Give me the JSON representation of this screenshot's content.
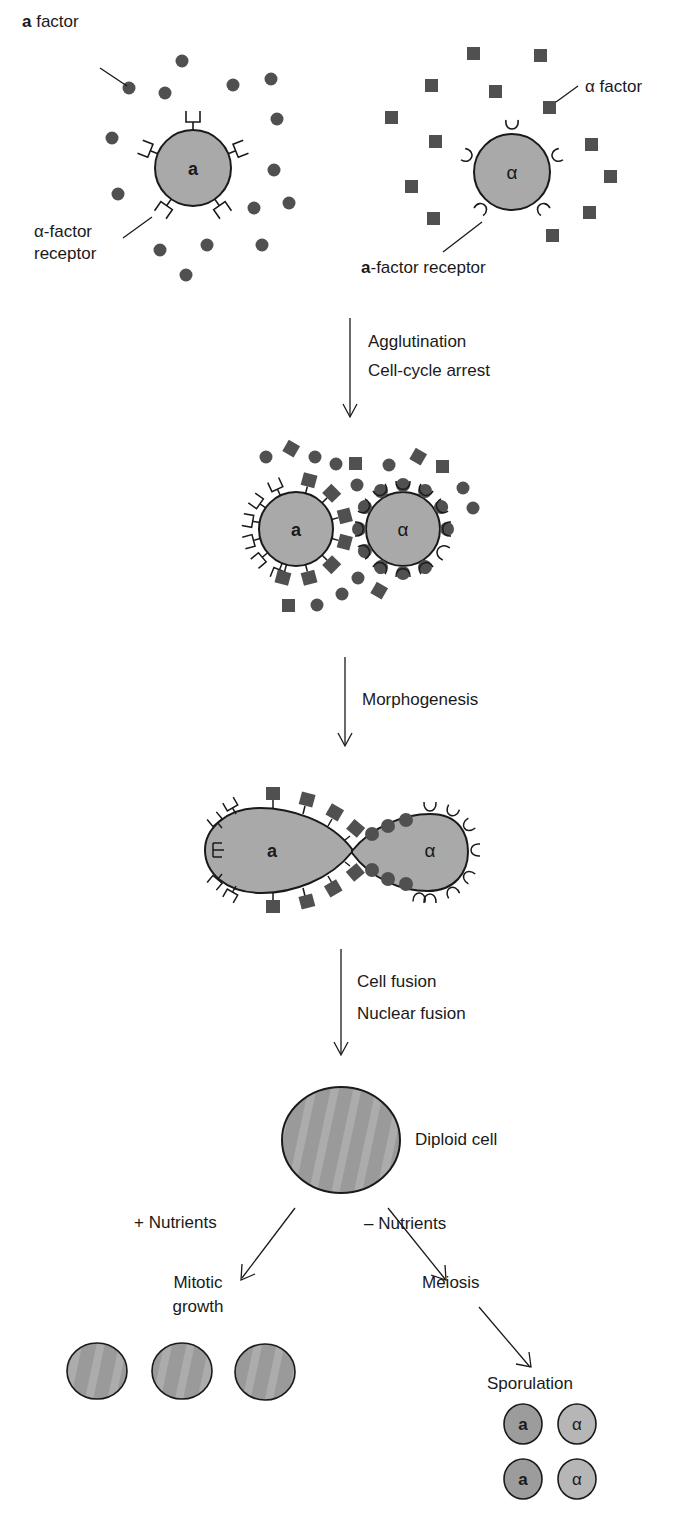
{
  "colors": {
    "cell_fill": "#a9a9a9",
    "cell_stroke": "#1a1a1a",
    "factor_fill": "#505050",
    "diploid_fill": "#9a9a9a",
    "spore_a_fill": "#9c9c9c",
    "spore_alpha_fill": "#b6b6b6",
    "text": "#1a1a1a",
    "background": "#ffffff"
  },
  "stage1": {
    "a_cell": {
      "label": "a",
      "factor_label_bold": "a",
      "factor_label_rest": " factor",
      "receptor_label_line1": "α-factor",
      "receptor_label_line2": "receptor",
      "factor_shape": "circle",
      "receptor_shape": "square-cup"
    },
    "alpha_cell": {
      "label": "α",
      "factor_label": "α factor",
      "receptor_label_bold": "a",
      "receptor_label_rest": "-factor receptor",
      "factor_shape": "square",
      "receptor_shape": "round-cup"
    }
  },
  "steps": [
    {
      "id": "step-1",
      "lines": [
        "Agglutination",
        "Cell-cycle arrest"
      ]
    },
    {
      "id": "step-2",
      "lines": [
        "Morphogenesis"
      ]
    },
    {
      "id": "step-3",
      "lines": [
        "Cell fusion",
        "Nuclear fusion"
      ]
    }
  ],
  "stage2": {
    "a_label": "a",
    "alpha_label": "α"
  },
  "stage3": {
    "a_label": "a",
    "alpha_label": "α"
  },
  "diploid": {
    "label": "Diploid cell"
  },
  "branches": {
    "left": {
      "condition": "+ Nutrients",
      "outcome_line1": "Mitotic",
      "outcome_line2": "growth",
      "cell_count": 3
    },
    "right": {
      "condition": "– Nutrients",
      "outcome": "Meiosis",
      "next": "Sporulation",
      "spores": [
        [
          "a",
          "α"
        ],
        [
          "a",
          "α"
        ]
      ]
    }
  }
}
